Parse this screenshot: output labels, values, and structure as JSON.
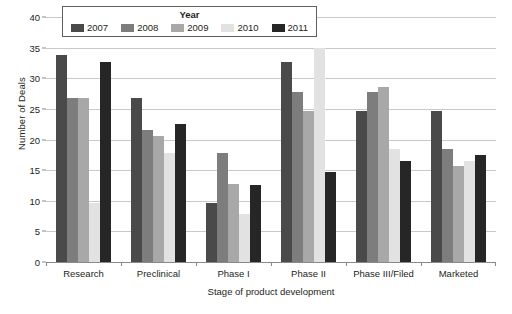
{
  "chart_data": {
    "type": "bar",
    "title": "",
    "xlabel": "Stage of product development",
    "ylabel": "Number of Deals",
    "ylim": [
      0,
      40
    ],
    "ytick_step": 5,
    "yticks": [
      0,
      5,
      10,
      15,
      20,
      25,
      30,
      35,
      40
    ],
    "grid": true,
    "legend_position": "top-left",
    "legend_title": "Year",
    "categories": [
      "Research",
      "Preclinical",
      "Phase I",
      "Phase II",
      "Phase III/Filed",
      "Marketed"
    ],
    "series": [
      {
        "name": "2007",
        "color": "#4a4a4a",
        "values": [
          33.8,
          26.7,
          9.7,
          32.7,
          24.7,
          24.7
        ]
      },
      {
        "name": "2008",
        "color": "#7d7d7d",
        "values": [
          26.7,
          21.6,
          17.8,
          27.7,
          27.7,
          18.5
        ]
      },
      {
        "name": "2009",
        "color": "#a8a8a8",
        "values": [
          26.7,
          20.5,
          12.7,
          24.7,
          28.6,
          15.7
        ]
      },
      {
        "name": "2010",
        "color": "#e2e2e2",
        "values": [
          9.7,
          17.8,
          7.8,
          35.0,
          18.5,
          16.5
        ]
      },
      {
        "name": "2011",
        "color": "#262626",
        "values": [
          32.7,
          22.6,
          12.6,
          14.7,
          16.5,
          17.5
        ]
      }
    ]
  },
  "legend": {
    "title": "Year",
    "items": [
      {
        "label": "2007",
        "color": "#4a4a4a"
      },
      {
        "label": "2008",
        "color": "#7d7d7d"
      },
      {
        "label": "2009",
        "color": "#a8a8a8"
      },
      {
        "label": "2010",
        "color": "#e2e2e2"
      },
      {
        "label": "2011",
        "color": "#262626"
      }
    ]
  },
  "axes": {
    "y_title": "Number of Deals",
    "x_title": "Stage of product development",
    "y_labels": [
      "0",
      "5",
      "10",
      "15",
      "20",
      "25",
      "30",
      "35",
      "40"
    ],
    "x_labels": [
      "Research",
      "Preclinical",
      "Phase I",
      "Phase II",
      "Phase III/Filed",
      "Marketed"
    ]
  },
  "source_note": ""
}
